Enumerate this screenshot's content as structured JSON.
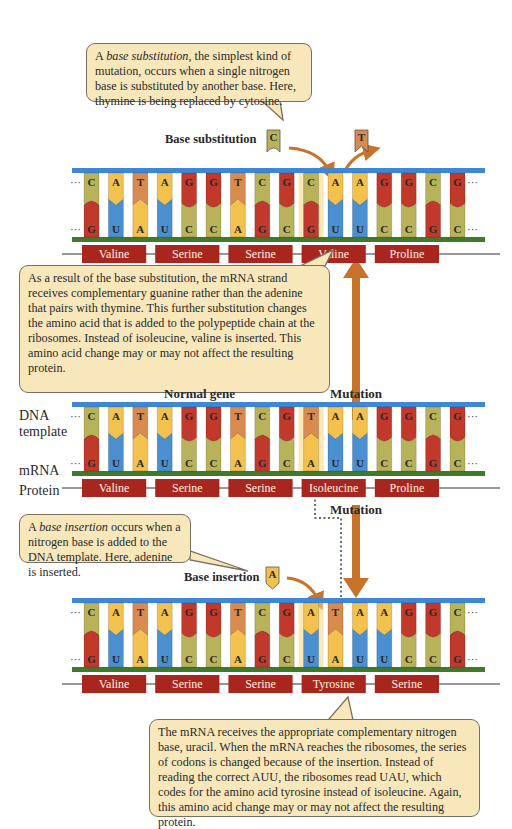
{
  "colors": {
    "adenine": "#f2c14e",
    "thymine": "#d98a4e",
    "guanine": "#c0392b",
    "cytosine": "#b8b35a",
    "uracil": "#4a8fd0",
    "dna_backbone": "#3d87d6",
    "mrna_backbone": "#3f7a2a",
    "protein_box": "#a8261e",
    "arrow": "#c8732c",
    "callout_bg": "#f7e7bb"
  },
  "callouts": {
    "substitution_intro": {
      "em": "base substitution",
      "pre": "A ",
      "post": ", the simplest kind of mutation, occurs when a single nitrogen base is substituted by another base. Here, thymine is being replaced by cytosine."
    },
    "substitution_result": "As a result of the base substitution, the mRNA strand receives complementary guanine rather than the adenine that pairs with thymine. This further substitution changes the amino acid that is added to the polypeptide chain at the ribosomes. Instead of isoleucine, valine is inserted. This amino acid change may or may not affect the resulting protein.",
    "insertion_intro": {
      "em": "base insertion",
      "pre": "A ",
      "post": " occurs when a nitrogen base is added to the DNA template. Here, adenine is inserted."
    },
    "insertion_result": "The mRNA receives the appropriate complementary nitrogen base, uracil. When the mRNA reaches the ribosomes, the series of codons is changed because of the insertion. Instead of reading the correct AUU, the ribosomes read UAU, which codes for the amino acid tyrosine instead of isoleucine. Again, this amino acid change may or may not affect the resulting protein."
  },
  "labels": {
    "base_substitution": "Base substitution",
    "base_insertion": "Base insertion",
    "normal_gene": "Normal gene",
    "mutation_top": "Mutation",
    "mutation_bottom": "Mutation",
    "dna_template": "DNA template",
    "mrna": "mRNA",
    "protein": "Protein",
    "ellipsis": "···"
  },
  "floating_bases": {
    "substitution_in": "C",
    "substitution_out": "T",
    "insertion_in": "A"
  },
  "strands": [
    {
      "name": "substitution",
      "dna": [
        "C",
        "A",
        "T",
        "A",
        "G",
        "G",
        "T",
        "C",
        "G",
        "C",
        "A",
        "A",
        "G",
        "G",
        "C",
        "G"
      ],
      "mrna": [
        "G",
        "U",
        "A",
        "U",
        "C",
        "C",
        "A",
        "G",
        "C",
        "G",
        "U",
        "U",
        "C",
        "C",
        "G",
        "C"
      ],
      "protein": [
        "Valine",
        "Serine",
        "Serine",
        "Valine",
        "Proline"
      ],
      "highlight_index": 9
    },
    {
      "name": "normal",
      "dna": [
        "C",
        "A",
        "T",
        "A",
        "G",
        "G",
        "T",
        "C",
        "G",
        "T",
        "A",
        "A",
        "G",
        "G",
        "C",
        "G"
      ],
      "mrna": [
        "G",
        "U",
        "A",
        "U",
        "C",
        "C",
        "A",
        "G",
        "C",
        "A",
        "U",
        "U",
        "C",
        "C",
        "G",
        "C"
      ],
      "protein": [
        "Valine",
        "Serine",
        "Serine",
        "Isoleucine",
        "Proline"
      ],
      "highlight_index": 9
    },
    {
      "name": "insertion",
      "dna": [
        "C",
        "A",
        "T",
        "A",
        "G",
        "G",
        "T",
        "C",
        "G",
        "A",
        "T",
        "A",
        "A",
        "G",
        "G",
        "C"
      ],
      "mrna": [
        "G",
        "U",
        "A",
        "U",
        "C",
        "C",
        "A",
        "G",
        "C",
        "U",
        "A",
        "U",
        "U",
        "C",
        "C",
        "G"
      ],
      "protein": [
        "Valine",
        "Serine",
        "Serine",
        "Tyrosine",
        "Serine"
      ],
      "highlight_index": 9
    }
  ]
}
